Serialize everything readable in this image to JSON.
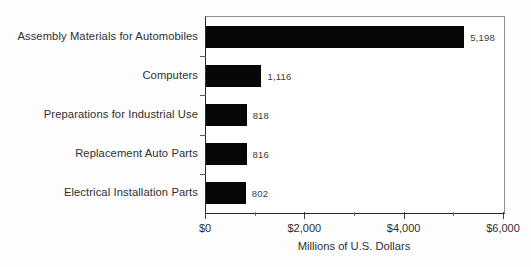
{
  "chart_data": {
    "type": "bar",
    "orientation": "horizontal",
    "title": "",
    "subtitle": "",
    "xlabel": "Millions of U.S. Dollars",
    "ylabel": "",
    "categories": [
      "Assembly Materials for Automobiles",
      "Computers",
      "Preparations for Industrial Use",
      "Replacement Auto Parts",
      "Electrical Installation Parts"
    ],
    "values": [
      5198,
      1116,
      818,
      816,
      802
    ],
    "value_labels": [
      "5,198",
      "1,116",
      "818",
      "816",
      "802"
    ],
    "xlim": [
      0,
      6000
    ],
    "xticks": [
      0,
      2000,
      4000,
      6000
    ],
    "xtick_labels": [
      "$0",
      "$2,000",
      "$4,000",
      "$6,000"
    ],
    "minor_xticks": [
      1000,
      3000,
      5000
    ],
    "grid": false,
    "legend": null,
    "bar_color": "#070707",
    "frame_color": "#8f8f8f",
    "axis_color": "#2b2b2b",
    "text_color": "#2f2f2f",
    "background": "#ffffff"
  }
}
